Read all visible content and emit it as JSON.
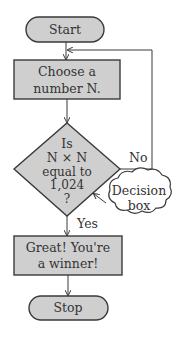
{
  "diagram": {
    "type": "flowchart",
    "nodes": {
      "start": {
        "shape": "terminal",
        "label": "Start"
      },
      "choose": {
        "shape": "process",
        "lines": [
          "Choose a",
          "number N."
        ]
      },
      "decision": {
        "shape": "decision",
        "lines": [
          "Is",
          "N × N",
          "equal to",
          "1,024",
          "?"
        ]
      },
      "winner": {
        "shape": "process",
        "lines": [
          "Great! You're",
          "a winner!"
        ]
      },
      "stop": {
        "shape": "terminal",
        "label": "Stop"
      }
    },
    "edges": [
      {
        "from": "start",
        "to": "choose",
        "label": ""
      },
      {
        "from": "choose",
        "to": "decision",
        "label": ""
      },
      {
        "from": "decision",
        "to": "choose",
        "label": "No"
      },
      {
        "from": "decision",
        "to": "winner",
        "label": "Yes"
      },
      {
        "from": "winner",
        "to": "stop",
        "label": ""
      }
    ],
    "callout": {
      "lines": [
        "Decision",
        "box"
      ],
      "points_to": "decision"
    },
    "colors": {
      "box_fill": "#cfcfcf",
      "stroke": "#3a3a3a",
      "text": "#333333"
    }
  }
}
